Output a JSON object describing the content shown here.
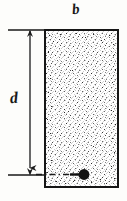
{
  "figure": {
    "kind": "engineering-cross-section-diagram",
    "background_color": "#fdfdfb",
    "ink_color": "#191919"
  },
  "labels": {
    "width_label": "b",
    "depth_label": "d"
  },
  "section": {
    "name": "concrete-section",
    "outline_color": "#161616",
    "outline_width_px": 2,
    "fill_pattern": "stipple",
    "fill_color": "#ffffff",
    "stipple_color": "#2a2a2a",
    "x": 45,
    "y": 30,
    "width": 73,
    "height": 157
  },
  "dimensions": {
    "depth": {
      "name": "depth-dimension",
      "label": "d",
      "line_x": 30,
      "top_y": 30,
      "bottom_y": 176,
      "arrow_style": "double-arrow",
      "extension_top": {
        "x1": 8,
        "x2": 46,
        "y": 30
      },
      "extension_bottom": {
        "x1": 8,
        "x2": 45,
        "y": 176
      }
    },
    "width": {
      "name": "width-dimension",
      "label": "b",
      "y": 14,
      "x1": 45,
      "x2": 118
    }
  },
  "rebar": {
    "name": "reinforcement-bar",
    "shape": "filled-circle",
    "color": "#121212",
    "center_x": 84,
    "center_y": 174,
    "radius": 5.5,
    "leader_line": {
      "style": "dash-dot",
      "from_x": 30,
      "to_x": 79,
      "y": 174
    }
  },
  "icons": {
    "arrow_down": "arrow-down-icon",
    "rebar_dot": "rebar-dot-icon"
  }
}
